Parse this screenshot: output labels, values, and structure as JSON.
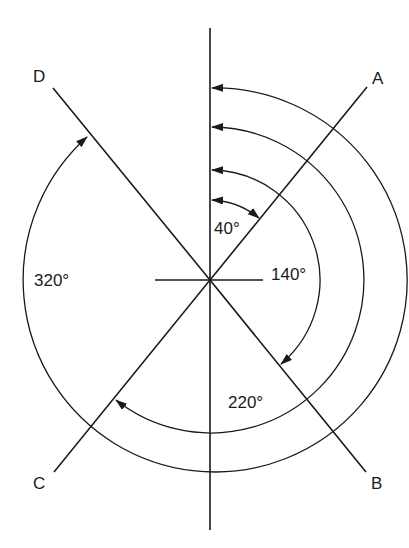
{
  "diagram": {
    "title": "",
    "center": {
      "x": 210,
      "y": 280
    },
    "colors": {
      "stroke": "#1a1a1a",
      "background": "#ffffff"
    },
    "lines": [
      {
        "id": "A",
        "label": "A",
        "angle_deg": 40
      },
      {
        "id": "B",
        "label": "B",
        "angle_deg": 140
      },
      {
        "id": "C",
        "label": "C",
        "angle_deg": 220
      },
      {
        "id": "D",
        "label": "D",
        "angle_deg": 320
      }
    ],
    "angles": [
      {
        "label": "40°",
        "to": "A",
        "radius": 80
      },
      {
        "label": "140°",
        "to": "B",
        "radius": 110
      },
      {
        "label": "220°",
        "to": "C",
        "radius": 153
      },
      {
        "label": "320°",
        "to": "D",
        "radius": 192
      }
    ],
    "labels": {
      "A": "A",
      "B": "B",
      "C": "C",
      "D": "D",
      "a40": "40°",
      "a140": "140°",
      "a220": "220°",
      "a320": "320°"
    }
  }
}
